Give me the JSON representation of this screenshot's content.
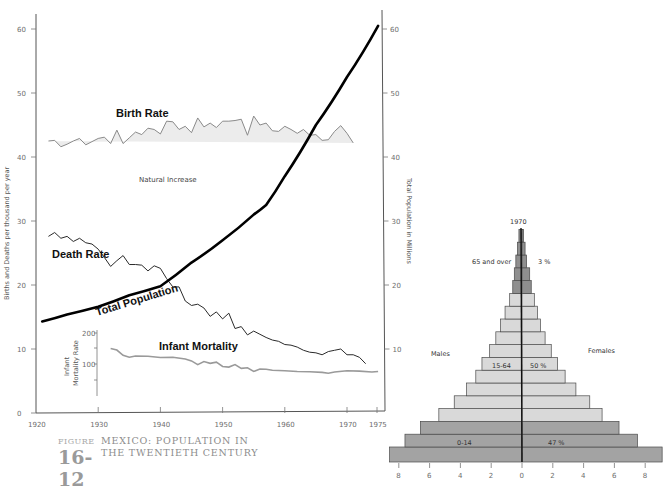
{
  "caption": {
    "figure_word": "FIGURE",
    "figure_number": "16-12",
    "title_line1": "MEXICO: POPULATION IN",
    "title_line2": "THE TWENTIETH CENTURY"
  },
  "colors": {
    "natural_increase_fill": "#ececec",
    "birth_rate_line": "#8a8a8a",
    "death_rate_line": "#2a2a2a",
    "population_line": "#000000",
    "infant_mortality_line": "#9a9a9a",
    "pyramid_dark": "#a3a3a3",
    "pyramid_mid": "#b7b7b7",
    "pyramid_light": "#d9d9d9",
    "pyramid_old": "#8f8f8f"
  },
  "chart_data": [
    {
      "type": "line",
      "title": "Mexico: Population in the Twentieth Century",
      "xlabel": "",
      "ylabel": "Births and Deaths per thousand per year",
      "y2label": "Total Population in Millions",
      "xlim": [
        1920,
        1975
      ],
      "ylim": [
        0,
        60
      ],
      "y2lim": [
        0,
        60
      ],
      "x_ticks": [
        1920,
        1930,
        1940,
        1950,
        1960,
        1970,
        1975
      ],
      "y_ticks": [
        0,
        10,
        20,
        30,
        40,
        50,
        60
      ],
      "y2_ticks": [
        10,
        20,
        30,
        40,
        50,
        60
      ],
      "grid": false,
      "annotations": [
        "Birth Rate",
        "Death Rate",
        "Total Population",
        "Natural Increase",
        "Infant Mortality"
      ],
      "series": [
        {
          "name": "Birth Rate",
          "axis": "left",
          "x": [
            1922,
            1923,
            1924,
            1925,
            1926,
            1927,
            1928,
            1929,
            1930,
            1931,
            1932,
            1933,
            1934,
            1935,
            1936,
            1937,
            1938,
            1939,
            1940,
            1941,
            1942,
            1943,
            1944,
            1945,
            1946,
            1947,
            1948,
            1949,
            1950,
            1951,
            1952,
            1953,
            1954,
            1955,
            1956,
            1957,
            1958,
            1959,
            1960,
            1961,
            1962,
            1963,
            1964,
            1965,
            1966,
            1967,
            1968,
            1969,
            1970,
            1971,
            1972,
            1973,
            1974,
            1975
          ],
          "values": [
            42.5,
            42.6,
            41.6,
            42.0,
            42.5,
            42.9,
            41.9,
            42.4,
            42.9,
            43.1,
            42.1,
            44.2,
            42.1,
            43.0,
            43.9,
            43.5,
            44.5,
            44.3,
            43.6,
            45.6,
            45.5,
            44.3,
            44.8,
            43.8,
            46.1,
            44.7,
            45.3,
            44.6,
            45.6,
            45.6,
            45.7,
            45.9,
            43.4,
            46.4,
            45.0,
            45.3,
            44.1,
            44.0,
            44.8,
            44.3,
            43.7,
            44.3,
            43.4,
            43.5,
            42.6,
            42.7,
            44.0,
            44.9,
            43.7,
            42.2
          ]
        },
        {
          "name": "Death Rate",
          "axis": "left",
          "x": [
            1922,
            1923,
            1924,
            1925,
            1926,
            1927,
            1928,
            1929,
            1930,
            1931,
            1932,
            1933,
            1934,
            1935,
            1936,
            1937,
            1938,
            1939,
            1940,
            1941,
            1942,
            1943,
            1944,
            1945,
            1946,
            1947,
            1948,
            1949,
            1950,
            1951,
            1952,
            1953,
            1954,
            1955,
            1956,
            1957,
            1958,
            1959,
            1960,
            1961,
            1962,
            1963,
            1964,
            1965,
            1966,
            1967,
            1968,
            1969,
            1970,
            1971,
            1972,
            1973,
            1974,
            1975
          ],
          "values": [
            27.6,
            28.2,
            27.3,
            27.6,
            26.8,
            27.3,
            26.6,
            26.4,
            25.6,
            24.3,
            22.9,
            23.8,
            24.6,
            23.2,
            23.2,
            23.1,
            22.2,
            23.0,
            22.6,
            21.0,
            19.7,
            19.7,
            17.5,
            16.8,
            17.0,
            16.4,
            15.1,
            15.8,
            14.7,
            15.6,
            13.2,
            13.5,
            12.2,
            12.8,
            12.3,
            11.8,
            11.4,
            11.2,
            10.7,
            10.6,
            10.3,
            9.8,
            9.5,
            9.4,
            9.1,
            9.6,
            9.8,
            10.0,
            9.1,
            9.1,
            8.7,
            7.7
          ]
        },
        {
          "name": "Total Population",
          "axis": "right",
          "unit": "millions",
          "x": [
            1921,
            1925,
            1930,
            1935,
            1940,
            1945,
            1950,
            1955,
            1957,
            1960,
            1965,
            1970,
            1975
          ],
          "values": [
            14.3,
            15.4,
            16.6,
            18.4,
            19.8,
            23.5,
            27.0,
            31.0,
            32.5,
            37.0,
            45.0,
            52.5,
            60.5
          ]
        },
        {
          "name": "Infant Mortality",
          "axis": "inset",
          "ylabel": "Infant Mortality Rate",
          "ylim": [
            0,
            200
          ],
          "y_ticks": [
            100,
            200
          ],
          "x": [
            1932,
            1933,
            1934,
            1935,
            1936,
            1938,
            1940,
            1942,
            1944,
            1945,
            1946,
            1947,
            1948,
            1949,
            1950,
            1951,
            1952,
            1953,
            1954,
            1955,
            1956,
            1957,
            1958,
            1960,
            1962,
            1964,
            1966,
            1967,
            1968,
            1970,
            1972,
            1974,
            1975
          ],
          "values": [
            150,
            145,
            128,
            122,
            126,
            125,
            121,
            122,
            116,
            110,
            98,
            108,
            102,
            106,
            92,
            90,
            98,
            86,
            88,
            76,
            84,
            83,
            80,
            78,
            76,
            75,
            73,
            70,
            74,
            78,
            77,
            74,
            76
          ]
        }
      ]
    },
    {
      "type": "bar",
      "subtype": "population_pyramid",
      "title": "1970",
      "xlabel": "",
      "x_ticks_left": [
        8,
        6,
        4,
        2,
        0
      ],
      "x_ticks_right": [
        2,
        4,
        6,
        8
      ],
      "xlim": [
        -8.6,
        9.2
      ],
      "left_label": "Males",
      "right_label": "Females",
      "groups": [
        {
          "name": "0-14",
          "percent": "47 %"
        },
        {
          "name": "15-64",
          "percent": "50 %"
        },
        {
          "name": "65 and over",
          "percent": "3 %"
        }
      ],
      "categories_bottom_to_top": [
        "cohort 1",
        "cohort 2",
        "cohort 3",
        "cohort 4",
        "cohort 5",
        "cohort 6",
        "cohort 7",
        "cohort 8",
        "cohort 9",
        "cohort 10",
        "cohort 11",
        "cohort 12",
        "cohort 13",
        "cohort 14",
        "cohort 15",
        "cohort 16",
        "cohort 17",
        "cohort 18"
      ],
      "series": [
        {
          "name": "Males",
          "values": [
            8.6,
            7.6,
            6.6,
            5.4,
            4.4,
            3.6,
            3.0,
            2.6,
            2.1,
            1.7,
            1.4,
            1.1,
            0.8,
            0.6,
            0.5,
            0.4,
            0.3,
            0.2
          ]
        },
        {
          "name": "Females",
          "values": [
            9.1,
            7.5,
            6.3,
            5.2,
            4.4,
            3.5,
            2.8,
            2.3,
            1.9,
            1.5,
            1.2,
            1.0,
            0.8,
            0.6,
            0.5,
            0.3,
            0.2,
            0.1
          ]
        }
      ],
      "group_of_bar": [
        "0-14",
        "0-14",
        "0-14",
        "15-64",
        "15-64",
        "15-64",
        "15-64",
        "15-64",
        "15-64",
        "15-64",
        "15-64",
        "15-64",
        "15-64",
        "65 and over",
        "65 and over",
        "65 and over",
        "65 and over",
        "65 and over"
      ]
    }
  ],
  "labels": {
    "birth_rate": "Birth Rate",
    "death_rate": "Death Rate",
    "total_population": "Total Population",
    "natural_increase": "Natural Increase",
    "infant_mortality": "Infant Mortality",
    "infant_axis_line1": "Infant",
    "infant_axis_line2": "Mortality Rate",
    "left_axis_title": "Births and Deaths per thousand per year",
    "right_axis_title": "Total Population in Millions",
    "pyramid_year": "1970",
    "males": "Males",
    "females": "Females",
    "age_65": "65 and over",
    "pct_65": "3 %",
    "age_15_64": "15-64",
    "pct_15_64": "50 %",
    "age_0_14": "0-14",
    "pct_0_14": "47 %"
  }
}
